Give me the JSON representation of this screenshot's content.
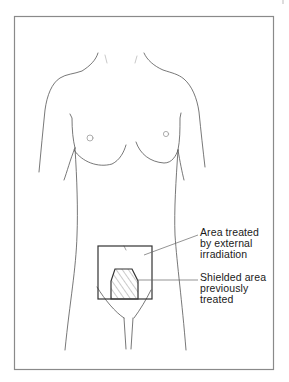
{
  "figure": {
    "type": "anatomical-diagram",
    "colors": {
      "outline": "#444444",
      "frame": "#8a8a8a",
      "field": "#333333",
      "hatch": "#555555",
      "text": "#1a1a1a"
    }
  },
  "annotations": [
    {
      "id": "area-treated",
      "lines": [
        "Area treated",
        "by external",
        "irradiation"
      ]
    },
    {
      "id": "shielded-area",
      "lines": [
        "Shielded area",
        "previously",
        "treated"
      ]
    }
  ]
}
